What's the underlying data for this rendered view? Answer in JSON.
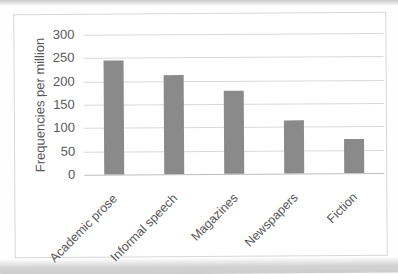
{
  "chart_data": {
    "type": "bar",
    "title": "",
    "categories": [
      "Academic prose",
      "Informal speech",
      "Magazines",
      "Newspapers",
      "Fiction"
    ],
    "values": [
      244,
      213,
      178,
      113,
      73
    ],
    "xlabel": "",
    "ylabel": "Frequencies per million",
    "ylim": [
      0,
      300
    ],
    "ytick_step": 50,
    "ytick_labels": [
      "0",
      "50",
      "100",
      "150",
      "200",
      "250",
      "300"
    ],
    "grid": "horizontal-only",
    "legend": "none",
    "colors": {
      "bar_fill": "#8a8a8a",
      "gridline": "#d9d9d9",
      "zero_axis_line": "#bcbcbc",
      "axis_text": "#595959",
      "frame_border": "#d7d7d7"
    }
  }
}
